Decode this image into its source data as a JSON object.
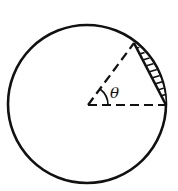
{
  "diagram": {
    "type": "circle-segment",
    "angle_label": "θ",
    "colors": {
      "stroke": "#111111",
      "background": "#ffffff"
    }
  }
}
